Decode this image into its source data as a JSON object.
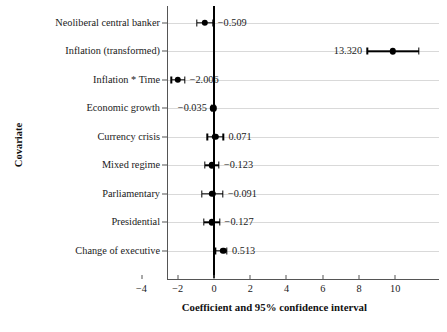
{
  "chart_data": {
    "type": "scatter",
    "subtype": "forest-plot",
    "title": "",
    "xlabel": "Coefficient and 95% confidence interval",
    "ylabel": "Covariate",
    "xlim": [
      -4.6,
      11.9
    ],
    "ylim": [
      0,
      11
    ],
    "grid": true,
    "legend": null,
    "reference_line": 0,
    "xticks": [
      -4,
      -2,
      0,
      2,
      4,
      6,
      8,
      10
    ],
    "xticklabels": [
      "−4",
      "−2",
      "0",
      "2",
      "4",
      "6",
      "8",
      "10"
    ],
    "categories": [
      "Neoliberal central banker",
      "Inflation (transformed)",
      "Inflation * Time",
      "Economic growth",
      "Currency crisis",
      "Mixed regime",
      "Parliamentary",
      "Presidential",
      "Change of executive"
    ],
    "points": [
      {
        "label": "Neoliberal central banker",
        "value": -0.509,
        "value_text": "−0.509",
        "ci_low": -0.95,
        "ci_high": -0.07,
        "label_side": "right"
      },
      {
        "label": "Inflation (transformed)",
        "value": 13.32,
        "value_text": "13.320",
        "ci_low": 8.45,
        "ci_high": 11.3,
        "label_side": "left"
      },
      {
        "label": "Inflation * Time",
        "value": -2.006,
        "value_text": "−2.006",
        "ci_low": -2.35,
        "ci_high": -1.62,
        "label_side": "right"
      },
      {
        "label": "Economic growth",
        "value": -0.035,
        "value_text": "−0.035",
        "ci_low": -0.12,
        "ci_high": 0.05,
        "label_side": "left"
      },
      {
        "label": "Currency crisis",
        "value": 0.071,
        "value_text": "0.071",
        "ci_low": -0.38,
        "ci_high": 0.52,
        "label_side": "right"
      },
      {
        "label": "Mixed regime",
        "value": -0.123,
        "value_text": "−0.123",
        "ci_low": -0.52,
        "ci_high": 0.28,
        "label_side": "right"
      },
      {
        "label": "Parliamentary",
        "value": -0.091,
        "value_text": "−0.091",
        "ci_low": -0.66,
        "ci_high": 0.49,
        "label_side": "right"
      },
      {
        "label": "Presidential",
        "value": -0.127,
        "value_text": "−0.127",
        "ci_low": -0.55,
        "ci_high": 0.31,
        "label_side": "right"
      },
      {
        "label": "Change of executive",
        "value": 0.513,
        "value_text": "0.513",
        "ci_low": 0.08,
        "ci_high": 0.72,
        "label_side": "right"
      }
    ],
    "colors": {
      "marker": "#000000",
      "line": "#000000",
      "grid": "#d9d9d9",
      "axis": "#555555",
      "text": "#1a1a1a",
      "background": "#ffffff"
    }
  },
  "axes": {
    "x_title": "Coefficient and 95% confidence interval",
    "y_title": "Covariate"
  }
}
